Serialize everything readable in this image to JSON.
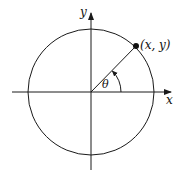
{
  "diagram": {
    "type": "unit-circle",
    "labels": {
      "x_axis": "x",
      "y_axis": "y",
      "point": "(x, y)",
      "angle": "θ"
    },
    "colors": {
      "stroke": "#1a1a1a",
      "background": "#ffffff"
    }
  }
}
